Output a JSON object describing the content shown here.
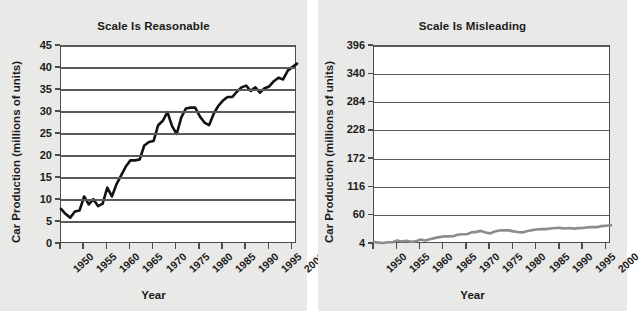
{
  "figure": {
    "background_color": "#e9e9e7",
    "plot_background_color": "#ffffff",
    "axis_color": "#4c4c4c",
    "gridline_color": "#5a5a5a"
  },
  "panels": [
    {
      "id": "reasonable",
      "title": "Scale Is Reasonable",
      "series_color": "#121212",
      "series_width": "2.6",
      "xlabel": "Year",
      "ylabel": "Car Production (millions of units)"
    },
    {
      "id": "misleading",
      "title": "Scale Is Misleading",
      "series_color": "#8c8c8c",
      "series_width": "2.6",
      "xlabel": "Year",
      "ylabel": "Car Production (millions of units)"
    }
  ],
  "chart_data": [
    {
      "type": "line",
      "title": "Scale Is Reasonable",
      "xlabel": "Year",
      "ylabel": "Car Production (millions of units)",
      "xlim": [
        1950,
        2001
      ],
      "ylim": [
        0,
        45
      ],
      "yticks": [
        0,
        5,
        10,
        15,
        20,
        25,
        30,
        35,
        40,
        45
      ],
      "xticks": [
        1950,
        1955,
        1960,
        1965,
        1970,
        1975,
        1980,
        1985,
        1990,
        1995,
        2000
      ],
      "xtick_labels": [
        "1950",
        "1955",
        "1960",
        "1965",
        "1970",
        "1975",
        "1980",
        "1985",
        "1990",
        "1995",
        "2000"
      ],
      "ytick_labels": [
        "0",
        "5",
        "10",
        "15",
        "20",
        "25",
        "30",
        "35",
        "40",
        "45"
      ],
      "grid": true,
      "legend": false,
      "line_color": "#121212",
      "x": [
        1950,
        1951,
        1952,
        1953,
        1954,
        1955,
        1956,
        1957,
        1958,
        1959,
        1960,
        1961,
        1962,
        1963,
        1964,
        1965,
        1966,
        1967,
        1968,
        1969,
        1970,
        1971,
        1972,
        1973,
        1974,
        1975,
        1976,
        1977,
        1978,
        1979,
        1980,
        1981,
        1982,
        1983,
        1984,
        1985,
        1986,
        1987,
        1988,
        1989,
        1990,
        1991,
        1992,
        1993,
        1994,
        1995,
        1996,
        1997,
        1998,
        1999,
        2000,
        2001
      ],
      "y": [
        8.0,
        6.8,
        6.0,
        7.4,
        7.6,
        10.8,
        9.0,
        10.2,
        8.6,
        9.2,
        12.8,
        10.8,
        13.6,
        15.6,
        17.6,
        19.0,
        19.0,
        19.2,
        22.4,
        23.2,
        23.4,
        27.0,
        28.0,
        30.0,
        26.8,
        25.0,
        28.8,
        30.8,
        31.0,
        31.0,
        29.0,
        27.6,
        27.0,
        29.6,
        31.4,
        32.6,
        33.4,
        33.4,
        34.6,
        35.6,
        36.0,
        34.8,
        35.6,
        34.4,
        35.4,
        35.8,
        37.0,
        37.8,
        37.4,
        39.4,
        40.2,
        41.0
      ]
    },
    {
      "type": "line",
      "title": "Scale Is Misleading",
      "xlabel": "Year",
      "ylabel": "Car Production (millions of units)",
      "xlim": [
        1950,
        2001
      ],
      "ylim": [
        4,
        396
      ],
      "yticks": [
        4,
        60,
        116,
        172,
        228,
        284,
        340,
        396
      ],
      "xticks": [
        1950,
        1955,
        1960,
        1965,
        1970,
        1975,
        1980,
        1985,
        1990,
        1995,
        2000
      ],
      "xtick_labels": [
        "1950",
        "1955",
        "1960",
        "1965",
        "1970",
        "1975",
        "1980",
        "1985",
        "1990",
        "1995",
        "2000"
      ],
      "ytick_labels": [
        "4",
        "60",
        "116",
        "172",
        "228",
        "284",
        "340",
        "396"
      ],
      "grid": true,
      "legend": false,
      "line_color": "#8c8c8c",
      "x": [
        1950,
        1951,
        1952,
        1953,
        1954,
        1955,
        1956,
        1957,
        1958,
        1959,
        1960,
        1961,
        1962,
        1963,
        1964,
        1965,
        1966,
        1967,
        1968,
        1969,
        1970,
        1971,
        1972,
        1973,
        1974,
        1975,
        1976,
        1977,
        1978,
        1979,
        1980,
        1981,
        1982,
        1983,
        1984,
        1985,
        1986,
        1987,
        1988,
        1989,
        1990,
        1991,
        1992,
        1993,
        1994,
        1995,
        1996,
        1997,
        1998,
        1999,
        2000,
        2001
      ],
      "y": [
        8.0,
        6.8,
        6.0,
        7.4,
        7.6,
        10.8,
        9.0,
        10.2,
        8.6,
        9.2,
        12.8,
        10.8,
        13.6,
        15.6,
        17.6,
        19.0,
        19.0,
        19.2,
        22.4,
        23.2,
        23.4,
        27.0,
        28.0,
        30.0,
        26.8,
        25.0,
        28.8,
        30.8,
        31.0,
        31.0,
        29.0,
        27.6,
        27.0,
        29.6,
        31.4,
        32.6,
        33.4,
        33.4,
        34.6,
        35.6,
        36.0,
        34.8,
        35.6,
        34.4,
        35.4,
        35.8,
        37.0,
        37.8,
        37.4,
        39.4,
        40.2,
        41.0
      ]
    }
  ]
}
